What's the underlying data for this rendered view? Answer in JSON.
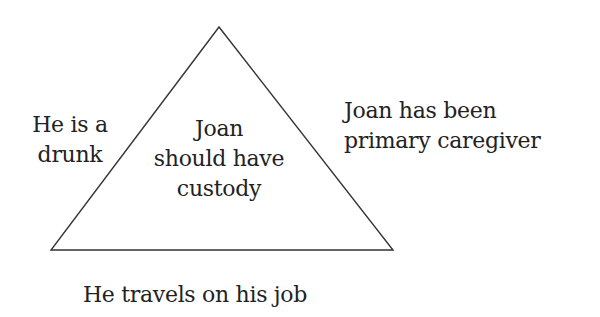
{
  "diagram": {
    "type": "triangle-argument",
    "center": {
      "lines": [
        "Joan",
        "should have",
        "custody"
      ]
    },
    "left": {
      "lines": [
        "He is a",
        "drunk"
      ]
    },
    "right": {
      "lines": [
        "Joan has been",
        "primary caregiver"
      ]
    },
    "bottom": {
      "lines": [
        "He travels on his job"
      ]
    },
    "colors": {
      "stroke": "#333333",
      "text": "#222222",
      "background": "#ffffff"
    }
  }
}
